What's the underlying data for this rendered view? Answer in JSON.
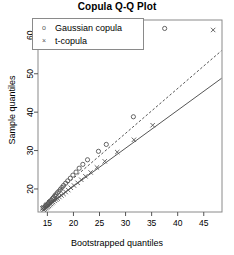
{
  "chart_data": {
    "type": "scatter",
    "title": "Copula Q-Q Plot",
    "xlabel": "Bootstrapped quantiles",
    "ylabel": "Sample quantiles",
    "xlim": [
      13.2,
      48.5
    ],
    "ylim": [
      14.0,
      64.0
    ],
    "xticks": [
      15,
      20,
      25,
      30,
      35,
      40,
      45
    ],
    "xticklabels": [
      "15",
      "20",
      "25",
      "30",
      "35",
      "40",
      "45"
    ],
    "yticks": [
      20,
      30,
      40,
      50,
      60
    ],
    "yticklabels": [
      "20",
      "30",
      "40",
      "50",
      "60"
    ],
    "grid": false,
    "legend_position": "top-left",
    "series": [
      {
        "name": "Gaussian copula",
        "marker": "circle",
        "color": "#555555",
        "points": [
          [
            14.2,
            15.0
          ],
          [
            14.4,
            15.2
          ],
          [
            14.6,
            15.5
          ],
          [
            14.8,
            15.7
          ],
          [
            15.0,
            16.0
          ],
          [
            15.2,
            16.3
          ],
          [
            15.4,
            16.5
          ],
          [
            15.6,
            16.9
          ],
          [
            15.8,
            17.1
          ],
          [
            16.0,
            17.5
          ],
          [
            16.2,
            17.8
          ],
          [
            16.4,
            18.2
          ],
          [
            16.6,
            18.5
          ],
          [
            16.9,
            19.0
          ],
          [
            17.2,
            19.4
          ],
          [
            17.5,
            19.9
          ],
          [
            17.8,
            20.4
          ],
          [
            18.1,
            20.9
          ],
          [
            18.5,
            21.5
          ],
          [
            18.9,
            22.1
          ],
          [
            19.4,
            22.8
          ],
          [
            19.9,
            23.6
          ],
          [
            20.5,
            24.4
          ],
          [
            21.1,
            25.4
          ],
          [
            21.8,
            26.4
          ],
          [
            22.7,
            27.6
          ],
          [
            24.8,
            29.8
          ],
          [
            26.3,
            31.6
          ],
          [
            31.5,
            38.8
          ],
          [
            37.5,
            61.8
          ]
        ]
      },
      {
        "name": "t-copula",
        "marker": "cross",
        "color": "#555555",
        "points": [
          [
            14.3,
            14.6
          ],
          [
            14.5,
            14.8
          ],
          [
            14.7,
            15.0
          ],
          [
            14.9,
            15.2
          ],
          [
            15.1,
            15.4
          ],
          [
            15.3,
            15.6
          ],
          [
            15.5,
            15.9
          ],
          [
            15.7,
            16.1
          ],
          [
            15.9,
            16.4
          ],
          [
            16.1,
            16.6
          ],
          [
            16.4,
            16.9
          ],
          [
            16.7,
            17.2
          ],
          [
            17.0,
            17.5
          ],
          [
            17.3,
            17.9
          ],
          [
            17.7,
            18.3
          ],
          [
            18.1,
            18.7
          ],
          [
            18.5,
            19.2
          ],
          [
            19.0,
            19.7
          ],
          [
            19.5,
            20.3
          ],
          [
            20.1,
            20.9
          ],
          [
            20.8,
            21.6
          ],
          [
            21.5,
            22.4
          ],
          [
            22.3,
            23.3
          ],
          [
            23.3,
            24.3
          ],
          [
            24.5,
            25.6
          ],
          [
            26.0,
            27.2
          ],
          [
            28.4,
            29.6
          ],
          [
            31.6,
            32.8
          ],
          [
            35.2,
            36.6
          ],
          [
            46.8,
            61.4
          ]
        ]
      }
    ],
    "reference_lines": [
      {
        "name": "identity-line",
        "style": "solid",
        "color": "#555555",
        "from": [
          13.6,
          14.4
        ],
        "to": [
          48.4,
          48.8
        ]
      },
      {
        "name": "confidence-line",
        "style": "dashed",
        "color": "#555555",
        "from": [
          13.6,
          15.3
        ],
        "to": [
          48.4,
          56.0
        ]
      }
    ]
  },
  "legend": {
    "items": [
      {
        "label": "Gaussian copula",
        "marker": "o"
      },
      {
        "label": "t-copula",
        "marker": "×"
      }
    ]
  }
}
